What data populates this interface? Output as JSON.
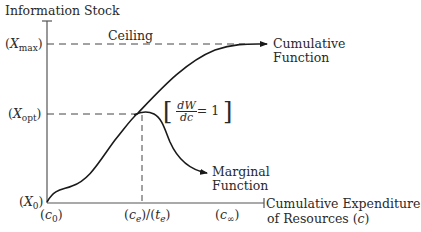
{
  "diagram": {
    "y_axis_title": "Information Stock",
    "x_axis_title_line1": "Cumulative Expenditure",
    "x_axis_title_line2_prefix": "of Resources (",
    "x_axis_title_var": "c",
    "x_axis_title_line2_suffix": ")",
    "ceiling_label": "Ceiling",
    "y_ticks": {
      "x_max": {
        "open": "(",
        "var": "X",
        "sub": "max",
        "close": ")"
      },
      "x_opt": {
        "open": "(",
        "var": "X",
        "sub": "opt",
        "close": ")"
      },
      "x_0": {
        "open": "(",
        "var": "X",
        "sub": "0",
        "close": ")"
      }
    },
    "x_ticks": {
      "c_0": {
        "open": "(",
        "var": "c",
        "sub": "0",
        "close": ")"
      },
      "c_e": {
        "open": "(",
        "var": "c",
        "sub": "e",
        "close": ")/(",
        "var2": "t",
        "sub2": "e",
        "close2": ")"
      },
      "c_inf": {
        "open": "(",
        "var": "c",
        "sub": "∞",
        "close": ")"
      }
    },
    "curves": {
      "cumulative_line1": "Cumulative",
      "cumulative_line2": "Function",
      "marginal_line1": "Marginal",
      "marginal_line2": "Function"
    },
    "annotation": {
      "left_bracket": "[",
      "numerator": "dW",
      "denominator": "dc",
      "equals": "= 1",
      "right_bracket": "]"
    },
    "colors": {
      "ink": "#1a1a1a",
      "axis": "#555555",
      "dash": "#444444"
    }
  }
}
